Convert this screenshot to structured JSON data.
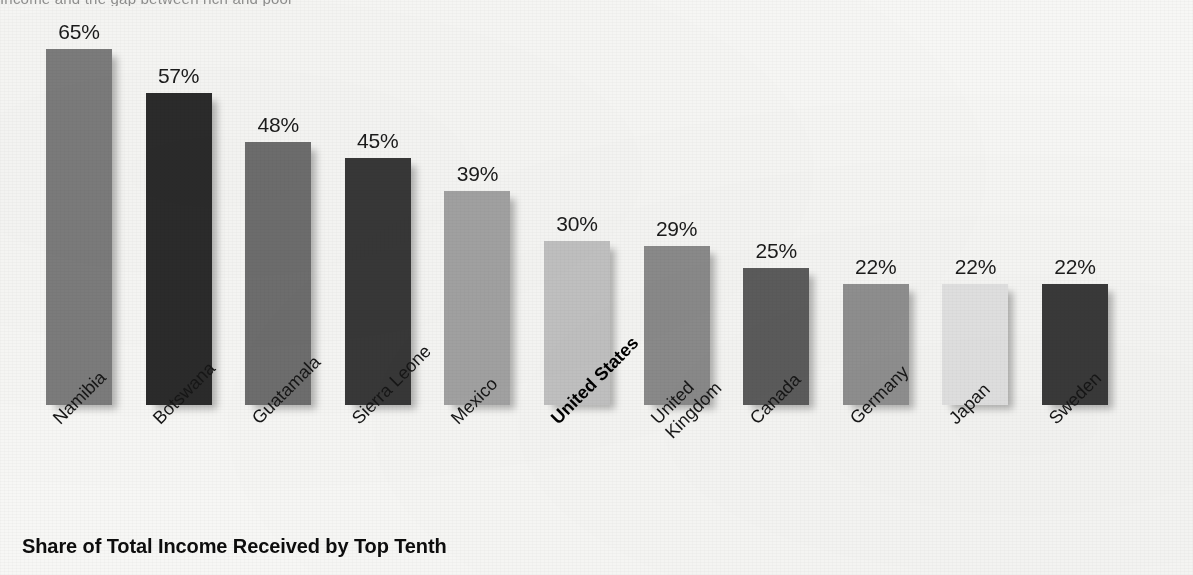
{
  "chart_data": {
    "type": "bar",
    "title": "Share of Total Income Received by Top Tenth",
    "subtitle": "",
    "xlabel": "",
    "ylabel": "",
    "ylim": [
      0,
      70
    ],
    "grid": false,
    "legend": "none",
    "value_suffix": "%",
    "categories": [
      "Namibia",
      "Botswana",
      "Guatamala",
      "Sierra Leone",
      "Mexico",
      "United States",
      "United Kingdom",
      "Canada",
      "Germany",
      "Japan",
      "Sweden"
    ],
    "values": [
      65,
      57,
      48,
      45,
      39,
      30,
      29,
      25,
      22,
      22,
      22
    ],
    "value_labels": [
      "65%",
      "57%",
      "48%",
      "45%",
      "39%",
      "30%",
      "29%",
      "25%",
      "22%",
      "22%",
      "22%"
    ],
    "bar_colors": [
      "#7c7c7c",
      "#2b2b2b",
      "#6e6e6e",
      "#383838",
      "#a3a3a3",
      "#c2c2c2",
      "#8b8b8b",
      "#5c5c5c",
      "#909090",
      "#e2e2e2",
      "#3a3a3a"
    ],
    "highlight_category": "United States",
    "annotations": []
  },
  "figure": {
    "top_clipped_caption": "Income and the gap between rich and poor",
    "background_color": "#f7f7f5"
  },
  "axis": {
    "category_label_lines": [
      [
        "Namibia"
      ],
      [
        "Botswana"
      ],
      [
        "Guatamala"
      ],
      [
        "Sierra Leone"
      ],
      [
        "Mexico"
      ],
      [
        "United States"
      ],
      [
        "United",
        "Kingdom"
      ],
      [
        "Canada"
      ],
      [
        "Germany"
      ],
      [
        "Japan"
      ],
      [
        "Sweden"
      ]
    ]
  }
}
